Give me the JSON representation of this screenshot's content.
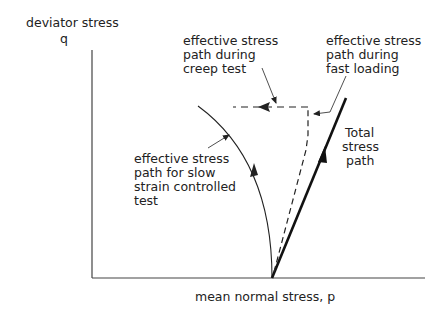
{
  "diagram": {
    "type": "stress-path-diagram",
    "y_axis": {
      "label_line1": "deviator stress",
      "label_line2": "q"
    },
    "x_axis": {
      "label": "mean normal stress, p"
    },
    "labels": {
      "creep": [
        "effective stress",
        "path during",
        "creep test"
      ],
      "fast": [
        "effective stress",
        "path during",
        "fast loading"
      ],
      "slow": [
        "effective stress",
        "path for slow",
        "strain controlled",
        "test"
      ],
      "total": [
        "Total",
        "stress",
        "path"
      ]
    },
    "colors": {
      "line": "#222222",
      "background": "#ffffff"
    }
  }
}
